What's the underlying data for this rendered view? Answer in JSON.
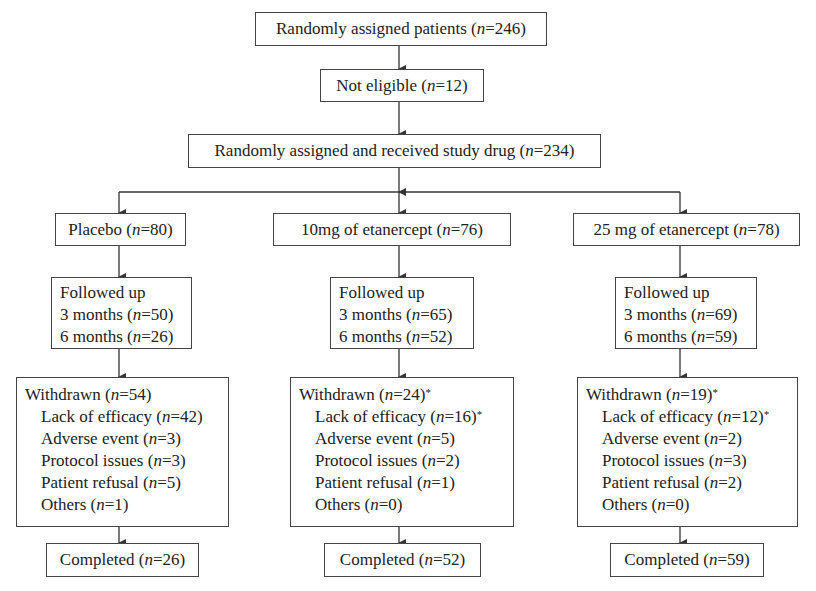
{
  "title_box": {
    "label": "Randomly assigned patients",
    "n": "246"
  },
  "not_eligible": {
    "label": "Not eligible",
    "n": "12"
  },
  "received": {
    "label": "Randomly assigned and received study drug",
    "n": "234"
  },
  "arms": [
    {
      "name": "Placebo",
      "n": "80",
      "followed": {
        "title": "Followed up",
        "rows": [
          {
            "label": "3 months",
            "n": "50"
          },
          {
            "label": "6 months",
            "n": "26"
          }
        ]
      },
      "withdrawn": {
        "label": "Withdrawn",
        "n": "54",
        "star": "",
        "reasons": [
          {
            "label": "Lack of efficacy",
            "n": "42",
            "star": ""
          },
          {
            "label": "Adverse event",
            "n": "3",
            "star": ""
          },
          {
            "label": "Protocol issues",
            "n": "3",
            "star": ""
          },
          {
            "label": "Patient refusal",
            "n": "5",
            "star": ""
          },
          {
            "label": "Others",
            "n": "1",
            "star": ""
          }
        ]
      },
      "completed": {
        "label": "Completed",
        "n": "26"
      }
    },
    {
      "name": "10mg of etanercept",
      "n": "76",
      "followed": {
        "title": "Followed up",
        "rows": [
          {
            "label": "3 months",
            "n": "65"
          },
          {
            "label": "6 months",
            "n": "52"
          }
        ]
      },
      "withdrawn": {
        "label": "Withdrawn",
        "n": "24",
        "star": "*",
        "reasons": [
          {
            "label": "Lack of efficacy",
            "n": "16",
            "star": "*"
          },
          {
            "label": "Adverse event",
            "n": "5",
            "star": ""
          },
          {
            "label": "Protocol issues",
            "n": "2",
            "star": ""
          },
          {
            "label": "Patient refusal",
            "n": "1",
            "star": ""
          },
          {
            "label": "Others",
            "n": "0",
            "star": ""
          }
        ]
      },
      "completed": {
        "label": "Completed",
        "n": "52"
      }
    },
    {
      "name": "25 mg of etanercept",
      "n": "78",
      "followed": {
        "title": "Followed up",
        "rows": [
          {
            "label": "3 months",
            "n": "69"
          },
          {
            "label": "6 months",
            "n": "59"
          }
        ]
      },
      "withdrawn": {
        "label": "Withdrawn",
        "n": "19",
        "star": "*",
        "reasons": [
          {
            "label": "Lack of efficacy",
            "n": "12",
            "star": "*"
          },
          {
            "label": "Adverse event",
            "n": "2",
            "star": ""
          },
          {
            "label": "Protocol issues",
            "n": "3",
            "star": ""
          },
          {
            "label": "Patient refusal",
            "n": "2",
            "star": ""
          },
          {
            "label": "Others",
            "n": "0",
            "star": ""
          }
        ]
      },
      "completed": {
        "label": "Completed",
        "n": "59"
      }
    }
  ],
  "n_symbol": "n",
  "colors": {
    "line": "#333333",
    "border": "#444444",
    "text": "#222222"
  }
}
